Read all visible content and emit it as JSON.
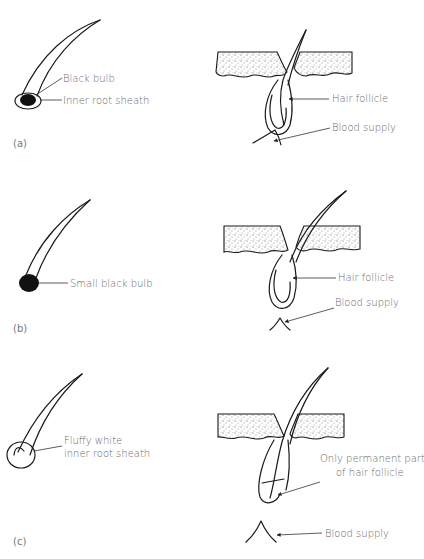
{
  "diagram": {
    "panels": [
      {
        "id": "a",
        "panel_label": "(a)",
        "hair_labels": [
          "Black bulb",
          "Inner root sheath"
        ],
        "follicle_labels": [
          "Hair follicle",
          "Blood supply"
        ]
      },
      {
        "id": "b",
        "panel_label": "(b)",
        "hair_labels": [
          "Small black bulb"
        ],
        "follicle_labels": [
          "Hair follicle",
          "Blood supply"
        ]
      },
      {
        "id": "c",
        "panel_label": "(c)",
        "hair_labels": [
          "Fluffy white",
          "inner root sheath"
        ],
        "follicle_labels": [
          "Only permanent part",
          "of hair follicle",
          "Blood supply"
        ]
      }
    ]
  }
}
